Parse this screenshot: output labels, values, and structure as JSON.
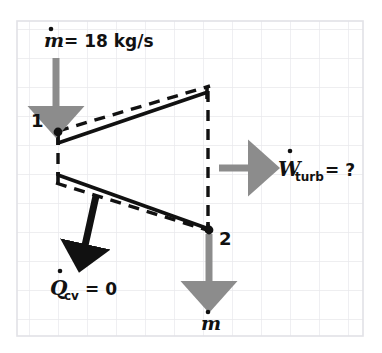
{
  "figure": {
    "background": "#ffffff",
    "grid": {
      "color": "#e9e9ec",
      "spacing": 29,
      "x0": 17,
      "y0": 21,
      "x1": 363,
      "y1": 336,
      "border_color": "#e2e2e6"
    },
    "colors": {
      "ink": "#111111",
      "flow_arrow": "#8c8c8c",
      "heat_arrow": "#111111",
      "dashed_boundary": "#111111"
    }
  },
  "labels": {
    "mass_flow_in": {
      "text": "= 18 kg/s",
      "symbol": "m",
      "overdot": "˙",
      "x": 44,
      "y": 44
    },
    "state_1": {
      "text": "1",
      "x": 33,
      "y": 120
    },
    "state_2": {
      "text": "2",
      "x": 220,
      "y": 238
    },
    "work_out": {
      "symbol": "W",
      "subscript": "turb",
      "suffix": "= ?",
      "overdot": "˙",
      "x": 280,
      "y": 170
    },
    "heat_transfer": {
      "symbol": "Q",
      "subscript": "cv",
      "suffix": "= 0",
      "overdot": "˙",
      "x": 52,
      "y": 288
    },
    "mass_flow_out": {
      "symbol": "m",
      "overdot": "˙",
      "x": 200,
      "y": 324
    }
  },
  "geometry": {
    "turbine_casing_top": {
      "x1": 58,
      "y1": 142,
      "x2": 208,
      "y2": 92
    },
    "turbine_casing_bottom": {
      "x1": 58,
      "y1": 175,
      "x2": 208,
      "y2": 228
    },
    "casing_cap_left_top": {
      "x1": 58,
      "y1": 131,
      "x2": 58,
      "y2": 143
    },
    "casing_cap_right_top": {
      "x1": 207,
      "y1": 88,
      "x2": 207,
      "y2": 100
    },
    "casing_cap_left_bottom": {
      "x1": 58,
      "y1": 172,
      "x2": 58,
      "y2": 184
    },
    "casing_cap_right_bottom": {
      "x1": 207,
      "y1": 222,
      "x2": 207,
      "y2": 234
    },
    "cv_boundary_top": {
      "x1": 58,
      "y1": 131,
      "x2": 210,
      "y2": 86
    },
    "cv_boundary_bottom": {
      "x1": 56,
      "y1": 183,
      "x2": 210,
      "y2": 231
    },
    "cv_boundary_left": {
      "x1": 58,
      "y1": 133,
      "x2": 58,
      "y2": 176
    },
    "cv_boundary_right": {
      "x1": 208,
      "y1": 90,
      "x2": 208,
      "y2": 229
    },
    "inlet_arrow": {
      "x1": 56,
      "y1": 58,
      "x2": 56,
      "y2": 130
    },
    "outlet_arrow": {
      "x1": 209,
      "y1": 232,
      "x2": 209,
      "y2": 305
    },
    "work_arrow": {
      "x1": 219,
      "y1": 168,
      "x2": 272,
      "y2": 168
    },
    "heat_arrow": {
      "x1": 96,
      "y1": 196,
      "x2": 80,
      "y2": 268
    },
    "state_1_dot": {
      "cx": 58,
      "cy": 132,
      "r": 4
    },
    "state_2_dot": {
      "cx": 209,
      "cy": 230,
      "r": 4
    }
  }
}
